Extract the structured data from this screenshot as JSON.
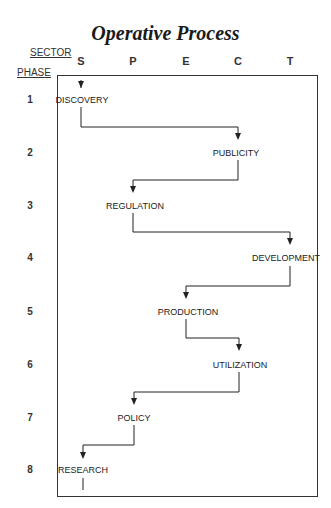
{
  "title": "Operative Process",
  "axis": {
    "sector_label": "SECTOR",
    "phase_label": "PHASE",
    "sectors": [
      "S",
      "P",
      "E",
      "C",
      "T"
    ],
    "phases": [
      "1",
      "2",
      "3",
      "4",
      "5",
      "6",
      "7",
      "8"
    ]
  },
  "nodes": [
    {
      "phase": "1",
      "sector": "S",
      "label": "DISCOVERY"
    },
    {
      "phase": "2",
      "sector": "C",
      "label": "PUBLICITY"
    },
    {
      "phase": "3",
      "sector": "P",
      "label": "REGULATION"
    },
    {
      "phase": "4",
      "sector": "T",
      "label": "DEVELOPMENT"
    },
    {
      "phase": "5",
      "sector": "E",
      "label": "PRODUCTION"
    },
    {
      "phase": "6",
      "sector": "C",
      "label": "UTILIZATION"
    },
    {
      "phase": "7",
      "sector": "P",
      "label": "POLICY"
    },
    {
      "phase": "8",
      "sector": "S",
      "label": "RESEARCH"
    }
  ]
}
